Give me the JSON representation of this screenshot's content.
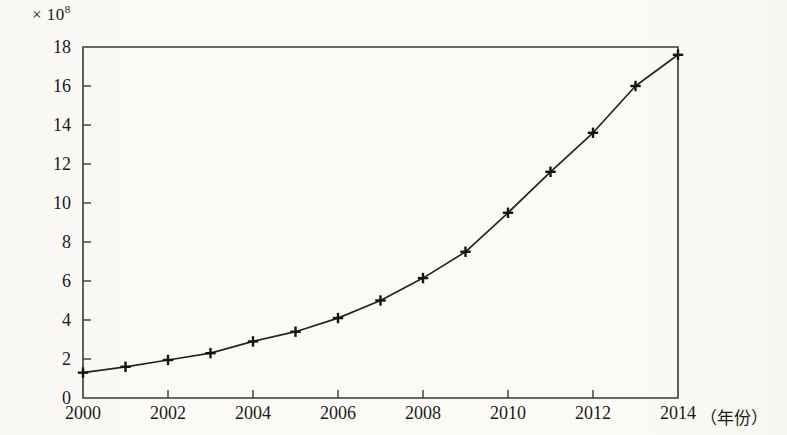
{
  "chart_data": {
    "type": "line",
    "title": "",
    "subtitle": "",
    "unit_label": "× 10",
    "unit_exponent": "8",
    "xlabel": "（年份）",
    "ylabel": "",
    "x": [
      2000,
      2001,
      2002,
      2003,
      2004,
      2005,
      2006,
      2007,
      2008,
      2009,
      2010,
      2011,
      2012,
      2013,
      2014
    ],
    "values": [
      1.3,
      1.6,
      1.95,
      2.3,
      2.9,
      3.4,
      4.1,
      5.0,
      6.15,
      7.5,
      9.5,
      11.6,
      13.6,
      16.0,
      17.6
    ],
    "series": [
      {
        "name": "",
        "values": [
          1.3,
          1.6,
          1.95,
          2.3,
          2.9,
          3.4,
          4.1,
          5.0,
          6.15,
          7.5,
          9.5,
          11.6,
          13.6,
          16.0,
          17.6
        ]
      }
    ],
    "xlim": [
      2000,
      2014
    ],
    "ylim": [
      0,
      18
    ],
    "ytick_labels": [
      "0",
      "2",
      "4",
      "6",
      "8",
      "10",
      "12",
      "14",
      "16",
      "18"
    ],
    "ytick_values": [
      0,
      2,
      4,
      6,
      8,
      10,
      12,
      14,
      16,
      18
    ],
    "xtick_labels": [
      "2000",
      "2002",
      "2004",
      "2006",
      "2008",
      "2010",
      "2012",
      "2014"
    ],
    "xtick_values": [
      2000,
      2002,
      2004,
      2006,
      2008,
      2010,
      2012,
      2014
    ],
    "grid": false,
    "legend": null,
    "marker": "plus-cross",
    "line_color": "#252525",
    "marker_color": "#141414",
    "axis_color": "#3a3a3a",
    "background_color": "#fbfaf7"
  }
}
